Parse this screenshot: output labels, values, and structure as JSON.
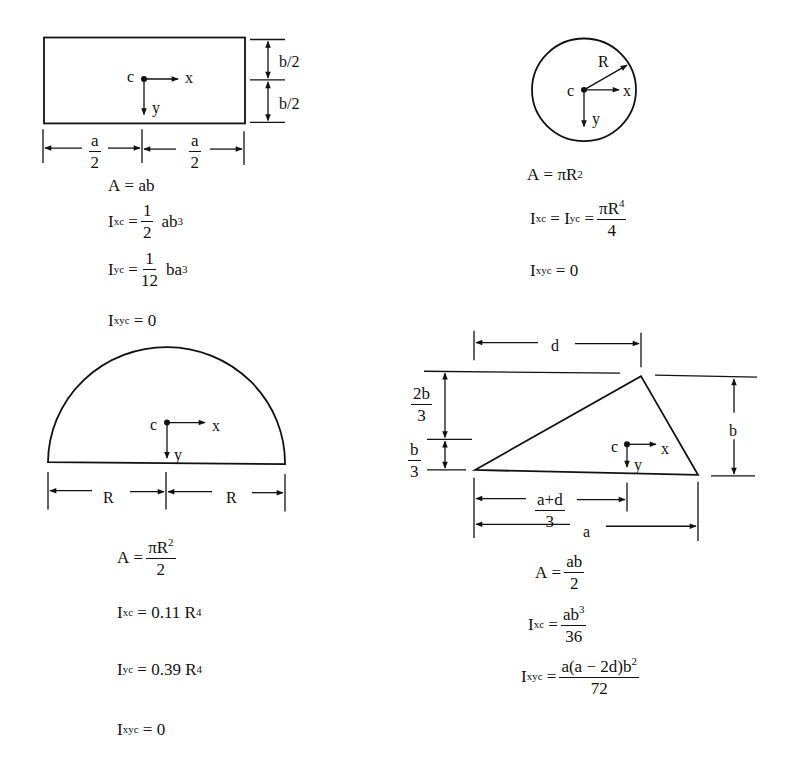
{
  "shapes": {
    "rectangle": {
      "labels": {
        "centroid": "c",
        "x_axis": "x",
        "y_axis": "y",
        "half_b_top": "b/2",
        "half_b_bottom": "b/2",
        "half_a_left_num": "a",
        "half_a_left_den": "2",
        "half_a_right_num": "a",
        "half_a_right_den": "2"
      },
      "formulas": {
        "area": {
          "lhs": "A",
          "rhs": "ab"
        },
        "ixc": {
          "lhs": "I",
          "sub": "xc",
          "num": "1",
          "den": "2",
          "tail": "ab",
          "tail_sup": "3"
        },
        "iyc": {
          "lhs": "I",
          "sub": "yc",
          "num": "1",
          "den": "12",
          "tail": "ba",
          "tail_sup": "3"
        },
        "ixyc": {
          "lhs": "I",
          "sub": "xyc",
          "rhs": "0"
        }
      }
    },
    "circle": {
      "labels": {
        "centroid": "c",
        "x_axis": "x",
        "y_axis": "y",
        "radius": "R"
      },
      "formulas": {
        "area": {
          "lhs": "A",
          "rhs": "πR",
          "rhs_sup": "2"
        },
        "ixc_iyc": {
          "lhs1": "I",
          "sub1": "xc",
          "lhs2": "I",
          "sub2": "yc",
          "num": "πR",
          "num_sup": "4",
          "den": "4"
        },
        "ixyc": {
          "lhs": "I",
          "sub": "xyc",
          "rhs": "0"
        }
      }
    },
    "semicircle": {
      "labels": {
        "centroid": "c",
        "x_axis": "x",
        "y_axis": "y",
        "r_left": "R",
        "r_right": "R"
      },
      "formulas": {
        "area": {
          "lhs": "A",
          "num": "πR",
          "num_sup": "2",
          "den": "2"
        },
        "ixc": {
          "lhs": "I",
          "sub": "xc",
          "rhs": "0.11 R",
          "rhs_sup": "4"
        },
        "iyc": {
          "lhs": "I",
          "sub": "yc",
          "rhs": "0.39 R",
          "rhs_sup": "4"
        },
        "ixyc": {
          "lhs": "I",
          "sub": "xyc",
          "rhs": "0"
        }
      }
    },
    "triangle": {
      "labels": {
        "centroid": "c",
        "x_axis": "x",
        "y_axis": "y",
        "d": "d",
        "b": "b",
        "a": "a",
        "two_b_third_num": "2b",
        "two_b_third_den": "3",
        "b_third_num": "b",
        "b_third_den": "3",
        "a_plus_d_third_num": "a+d",
        "a_plus_d_third_den": "3"
      },
      "formulas": {
        "area": {
          "lhs": "A",
          "num": "ab",
          "den": "2"
        },
        "ixc": {
          "lhs": "I",
          "sub": "xc",
          "num": "ab",
          "num_sup": "3",
          "den": "36"
        },
        "ixyc": {
          "lhs": "I",
          "sub": "xyc",
          "num": "a(a − 2d)b",
          "num_sup": "2",
          "den": "72"
        }
      }
    }
  }
}
